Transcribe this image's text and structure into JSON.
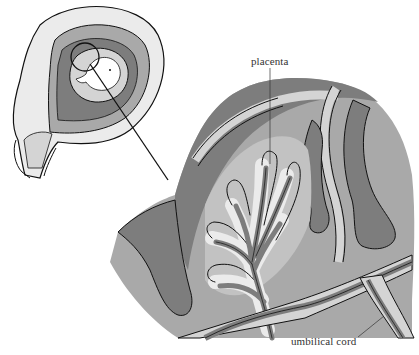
{
  "diagram": {
    "type": "anatomical illustration",
    "labels": {
      "placenta": "placenta",
      "umbilical_cord": "umbilical cord"
    },
    "inset": {
      "description": "uterus containing embryo, circled region magnified"
    },
    "colors": {
      "dark_tissue": "#7d7d7d",
      "mid_tissue": "#a9a9a9",
      "light_tissue": "#d4d4d4",
      "pale_tissue": "#ebebeb",
      "outline": "#111111",
      "background": "#ffffff"
    }
  }
}
